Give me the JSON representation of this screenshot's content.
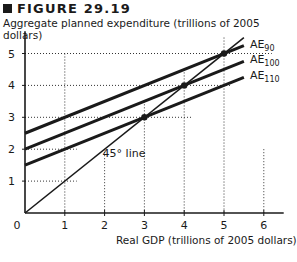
{
  "figure": {
    "title": "FIGURE 29.19",
    "ylabel": "Aggregate planned expenditure (trillions of 2005 dollars)",
    "xlabel": "Real GDP (trillions of 2005 dollars)",
    "line_45_label": "45° line",
    "origin_label": "0"
  },
  "chart_data": {
    "type": "line",
    "title": "FIGURE 29.19",
    "xlabel": "Real GDP (trillions of 2005 dollars)",
    "ylabel": "Aggregate planned expenditure (trillions of 2005 dollars)",
    "xlim": [
      0,
      6.5
    ],
    "ylim": [
      0,
      5.5
    ],
    "xticks": [
      0,
      1,
      2,
      3,
      4,
      5,
      6
    ],
    "yticks": [
      1,
      2,
      3,
      4,
      5
    ],
    "grid": "dotted at equilibrium points",
    "series": [
      {
        "name": "AE90",
        "label_main": "AE",
        "label_sub": "90",
        "x": [
          0,
          5.5
        ],
        "y": [
          2.5,
          5.25
        ]
      },
      {
        "name": "AE100",
        "label_main": "AE",
        "label_sub": "100",
        "x": [
          0,
          5.5
        ],
        "y": [
          2.0,
          4.75
        ]
      },
      {
        "name": "AE110",
        "label_main": "AE",
        "label_sub": "110",
        "x": [
          0,
          5.5
        ],
        "y": [
          1.5,
          4.25
        ]
      },
      {
        "name": "45° line",
        "x": [
          0,
          5.5
        ],
        "y": [
          0,
          5.5
        ]
      }
    ],
    "equilibrium_points": [
      {
        "series": "AE90",
        "x": 5,
        "y": 5
      },
      {
        "series": "AE100",
        "x": 4,
        "y": 4
      },
      {
        "series": "AE110",
        "x": 3,
        "y": 3
      }
    ]
  }
}
